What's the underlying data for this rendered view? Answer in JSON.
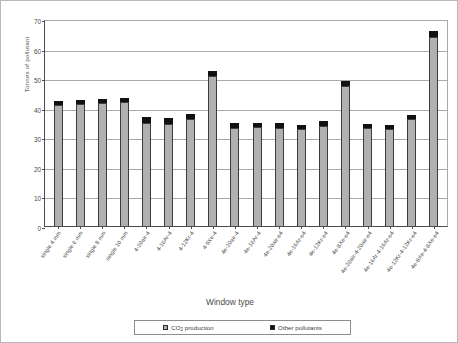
{
  "chart_data": {
    "type": "bar",
    "title": "",
    "subtitle": "",
    "xlabel": "Window type",
    "ylabel": "Tonnes of pollutant",
    "ylim": [
      0,
      70
    ],
    "ytick_step": 10,
    "yticks": [
      0,
      10,
      20,
      30,
      40,
      50,
      60,
      70
    ],
    "grid": true,
    "stacked": true,
    "legend_position": "bottom",
    "legend": [
      "CO2 production",
      "Other pollutants"
    ],
    "categories": [
      "single 4 mm",
      "single 6 mm",
      "single 8 mm",
      "single 10 mm",
      "4-20air-4",
      "4-16Ar-4",
      "4-12Kr-4",
      "4-9Xe-4",
      "4e-20air-4",
      "4e-16Ar-4",
      "4e-20air-e4",
      "4e-16Ar-e4",
      "4e-12Kr-e4",
      "4e-8Xe-e4",
      "4e-20air-4-20air-e4",
      "4e-16Ar-4-16Ar-e4",
      "4e-12Kr-4-12Kr-e4",
      "4e-8Xe-4-8Xe-e4"
    ],
    "series": [
      {
        "name": "CO2 production",
        "color": "#b0b0b0",
        "values": [
          41.0,
          41.3,
          41.5,
          41.8,
          34.8,
          34.6,
          36.2,
          50.8,
          33.2,
          33.4,
          33.3,
          32.8,
          33.8,
          47.5,
          33.0,
          32.8,
          36.2,
          64.0
        ]
      },
      {
        "name": "Other pollutants",
        "color": "#111111",
        "values": [
          1.2,
          1.3,
          1.3,
          1.4,
          1.9,
          1.8,
          1.8,
          1.6,
          1.5,
          1.4,
          1.4,
          1.4,
          1.6,
          1.6,
          1.4,
          1.4,
          1.5,
          1.9
        ]
      }
    ],
    "totals": [
      42.2,
      42.6,
      42.8,
      43.2,
      36.7,
      36.4,
      38.0,
      52.4,
      34.7,
      34.8,
      34.7,
      34.2,
      35.4,
      49.1,
      34.4,
      34.2,
      37.7,
      65.9
    ]
  },
  "legend": {
    "entries": [
      {
        "label_prefix": "CO",
        "label_sub": "2",
        "label_suffix": " production",
        "swatch": "co2"
      },
      {
        "label_prefix": "Other pollutants",
        "label_sub": "",
        "label_suffix": "",
        "swatch": "other"
      }
    ],
    "co2_prefix": "CO",
    "co2_sub": "2",
    "co2_suffix": " production",
    "other_label": "Other pollutants"
  }
}
